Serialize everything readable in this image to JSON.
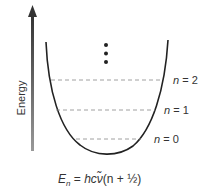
{
  "diagram": {
    "axis": {
      "label": "Energy",
      "direction": "up"
    },
    "levels": [
      {
        "n": "n",
        "eq": "= 2",
        "y": 80
      },
      {
        "n": "n",
        "eq": "= 1",
        "y": 110
      },
      {
        "n": "n",
        "eq": "= 0",
        "y": 139
      }
    ],
    "continuation": "vertical-ellipsis",
    "formula": {
      "lhs_var": "E",
      "lhs_sub": "n",
      "equals": " = ",
      "rhs_hc": "hc",
      "rhs_nu": "ν̃",
      "rhs_tail": "(n + ½)"
    },
    "colors": {
      "curve": "#222222",
      "dash": "#888888",
      "arrow": "#555555",
      "text": "#333333"
    }
  }
}
